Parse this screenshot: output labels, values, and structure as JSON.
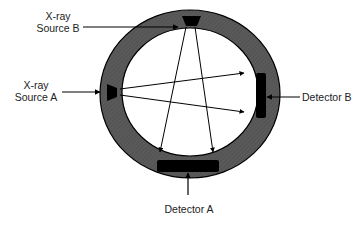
{
  "labels": {
    "source_b_line1": "X-ray",
    "source_b_line2": "Source B",
    "source_a_line1": "X-ray",
    "source_a_line2": "Source A",
    "detector_b": "Detector B",
    "detector_a": "Detector A"
  },
  "colors": {
    "ring": "#555555",
    "ring_stroke": "#000000",
    "bore": "#ffffff",
    "component": "#000000",
    "text": "#222222",
    "background": "#ffffff"
  },
  "components": [
    {
      "id": "source-a",
      "type": "x-ray source",
      "position": "left of ring"
    },
    {
      "id": "source-b",
      "type": "x-ray source",
      "position": "top of ring"
    },
    {
      "id": "detector-a",
      "type": "detector",
      "position": "bottom of ring"
    },
    {
      "id": "detector-b",
      "type": "detector",
      "position": "right of ring"
    }
  ],
  "beams": [
    {
      "from": "source-a",
      "to": "detector-b",
      "count": 2
    },
    {
      "from": "source-b",
      "to": "detector-a",
      "count": 2
    }
  ]
}
